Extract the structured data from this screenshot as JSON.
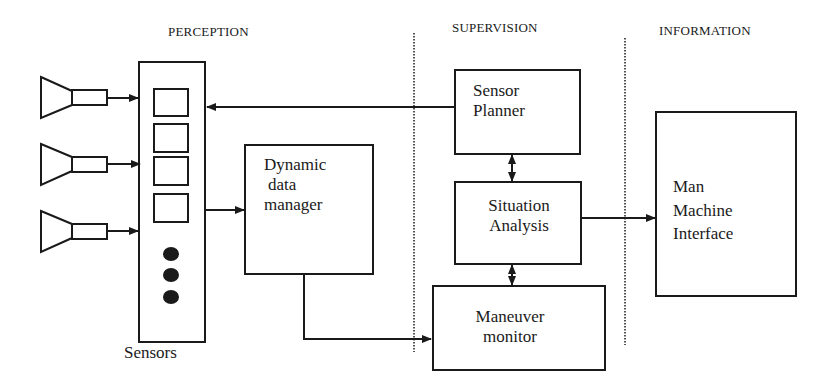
{
  "sections": [
    {
      "label": "PERCEPTION"
    },
    {
      "label": "SUPERVISION"
    },
    {
      "label": "INFORMATION"
    }
  ],
  "blocks": {
    "sensors": {
      "label": "Sensors",
      "slot_count": 4,
      "dot_count": 3
    },
    "dynamic_data_manager": {
      "lines": [
        "Dynamic",
        "data",
        "manager"
      ]
    },
    "sensor_planner": {
      "lines": [
        "Sensor",
        "Planner"
      ]
    },
    "situation_analysis": {
      "lines": [
        "Situation",
        "Analysis"
      ]
    },
    "maneuver_monitor": {
      "lines": [
        "Maneuver",
        "monitor"
      ]
    },
    "man_machine_interface": {
      "lines": [
        "Man",
        "Machine",
        "Interface"
      ]
    }
  },
  "antennas": [
    {
      "id": 1
    },
    {
      "id": 2
    },
    {
      "id": 3
    }
  ],
  "connections": [
    {
      "from": "antenna-1",
      "to": "sensors",
      "type": "arrow"
    },
    {
      "from": "antenna-2",
      "to": "sensors",
      "type": "arrow"
    },
    {
      "from": "antenna-3",
      "to": "sensors",
      "type": "arrow"
    },
    {
      "from": "sensor_planner",
      "to": "sensors",
      "type": "arrow"
    },
    {
      "from": "sensors",
      "to": "dynamic_data_manager",
      "type": "arrow"
    },
    {
      "from": "dynamic_data_manager",
      "to": "maneuver_monitor",
      "type": "arrow"
    },
    {
      "from": "sensor_planner",
      "to": "situation_analysis",
      "type": "bidirectional"
    },
    {
      "from": "situation_analysis",
      "to": "maneuver_monitor",
      "type": "bidirectional"
    },
    {
      "from": "situation_analysis",
      "to": "man_machine_interface",
      "type": "arrow"
    }
  ],
  "colors": {
    "stroke": "#1a1a1a",
    "background": "#ffffff"
  }
}
